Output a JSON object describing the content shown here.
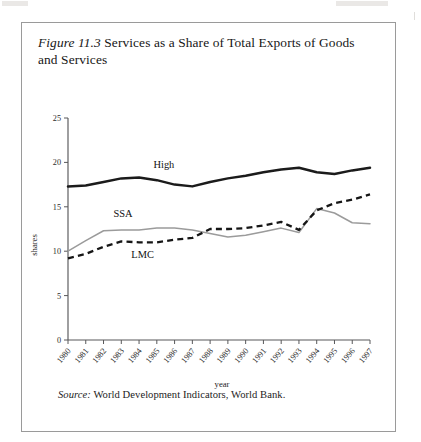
{
  "figure": {
    "number_label": "Figure 11.3",
    "title_text": " Services as a Share of Total Exports of Goods and Services",
    "source_label": "Source:",
    "source_text": " World Development Indicators, World Bank."
  },
  "chart_data": {
    "type": "line",
    "title": "Figure 11.3 Services as a Share of Total Exports of Goods and Services",
    "xlabel": "year",
    "ylabel": "shares",
    "xlim": [
      1980,
      1997
    ],
    "ylim": [
      0,
      25
    ],
    "yticks": [
      0,
      5,
      10,
      15,
      20,
      25
    ],
    "grid": false,
    "legend": "inline-labels",
    "x": [
      1980,
      1981,
      1982,
      1983,
      1984,
      1985,
      1986,
      1987,
      1988,
      1989,
      1990,
      1991,
      1992,
      1993,
      1994,
      1995,
      1996,
      1997
    ],
    "categories": [
      "1980",
      "1981",
      "1982",
      "1983",
      "1984",
      "1985",
      "1986",
      "1987",
      "1988",
      "1989",
      "1990",
      "1991",
      "1992",
      "1993",
      "1994",
      "1995",
      "1996",
      "1997"
    ],
    "series": [
      {
        "name": "High",
        "style": "solid-thick-black",
        "color": "#1b1b1b",
        "values": [
          17.3,
          17.4,
          17.8,
          18.2,
          18.3,
          18.0,
          17.5,
          17.3,
          17.8,
          18.2,
          18.5,
          18.9,
          19.2,
          19.4,
          18.9,
          18.7,
          19.1,
          19.4
        ]
      },
      {
        "name": "SSA",
        "style": "solid-thin-gray",
        "color": "#9b9b9b",
        "values": [
          10.0,
          11.2,
          12.3,
          12.4,
          12.4,
          12.6,
          12.6,
          12.4,
          12.0,
          11.6,
          11.8,
          12.2,
          12.6,
          12.1,
          14.8,
          14.3,
          13.2,
          13.1
        ]
      },
      {
        "name": "LMC",
        "style": "dashed-black",
        "color": "#161616",
        "values": [
          9.2,
          9.7,
          10.5,
          11.1,
          11.0,
          11.0,
          11.3,
          11.5,
          12.5,
          12.5,
          12.6,
          12.9,
          13.3,
          12.4,
          14.6,
          15.4,
          15.8,
          16.4
        ]
      }
    ],
    "series_label_positions": [
      {
        "name": "High",
        "x": 1985.4,
        "y": 19.4
      },
      {
        "name": "SSA",
        "x": 1983.1,
        "y": 13.9
      },
      {
        "name": "LMC",
        "x": 1984.2,
        "y": 9.2
      }
    ]
  },
  "axes": {
    "y_tick_labels": [
      "0",
      "5",
      "10",
      "15",
      "20",
      "25"
    ],
    "x_tick_labels": [
      "1980",
      "1981",
      "1982",
      "1983",
      "1984",
      "1985",
      "1986",
      "1987",
      "1988",
      "1989",
      "1990",
      "1991",
      "1992",
      "1993",
      "1994",
      "1995",
      "1996",
      "1997"
    ],
    "y_axis_title": "shares",
    "x_axis_title": "year"
  }
}
